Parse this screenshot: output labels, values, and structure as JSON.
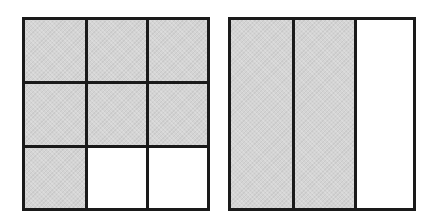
{
  "diagram": {
    "colors": {
      "outline": "#1a1a1a",
      "shaded": "#d4d4d4",
      "unshaded": "#ffffff"
    },
    "left_grid": {
      "rows": 3,
      "cols": 3,
      "shaded_count": 7,
      "total_parts": 9,
      "cells": [
        {
          "row": 0,
          "col": 0,
          "shaded": true
        },
        {
          "row": 0,
          "col": 1,
          "shaded": true
        },
        {
          "row": 0,
          "col": 2,
          "shaded": true
        },
        {
          "row": 1,
          "col": 0,
          "shaded": true
        },
        {
          "row": 1,
          "col": 1,
          "shaded": true
        },
        {
          "row": 1,
          "col": 2,
          "shaded": true
        },
        {
          "row": 2,
          "col": 0,
          "shaded": true
        },
        {
          "row": 2,
          "col": 1,
          "shaded": false
        },
        {
          "row": 2,
          "col": 2,
          "shaded": false
        }
      ]
    },
    "right_strips": {
      "rows": 1,
      "cols": 3,
      "shaded_count": 2,
      "total_parts": 3,
      "cells": [
        {
          "col": 0,
          "shaded": true
        },
        {
          "col": 1,
          "shaded": true
        },
        {
          "col": 2,
          "shaded": false
        }
      ]
    }
  }
}
